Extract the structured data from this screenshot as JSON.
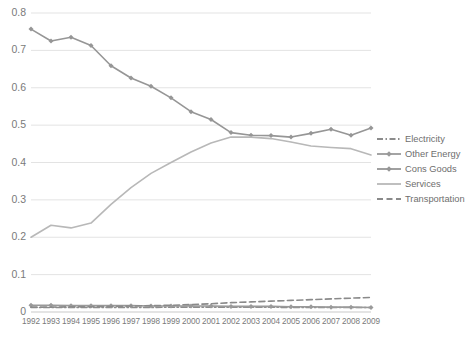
{
  "chart_data": {
    "type": "line",
    "title": "",
    "xlabel": "",
    "ylabel": "",
    "x": [
      1992,
      1993,
      1994,
      1995,
      1996,
      1997,
      1998,
      1999,
      2000,
      2001,
      2002,
      2003,
      2004,
      2005,
      2006,
      2007,
      2008,
      2009
    ],
    "xtick_labels": [
      "1992",
      "1993",
      "1994",
      "1995",
      "1996",
      "1997",
      "1998",
      "1999",
      "2000",
      "2001",
      "2002",
      "2003",
      "2004",
      "2005",
      "2006",
      "2007",
      "2008",
      "2009"
    ],
    "ytick_labels": [
      "0",
      "0.1",
      "0.2",
      "0.3",
      "0.4",
      "0.5",
      "0.6",
      "0.7",
      "0.8"
    ],
    "yticks": [
      0,
      0.1,
      0.2,
      0.3,
      0.4,
      0.5,
      0.6,
      0.7,
      0.8
    ],
    "ylim": [
      0,
      0.8
    ],
    "grid": "horizontal",
    "legend_position": "right",
    "series": [
      {
        "name": "Electricity",
        "color": "#8c8c8c",
        "style": "dash-dot",
        "marker": "none",
        "values": [
          0.012,
          0.012,
          0.012,
          0.012,
          0.012,
          0.012,
          0.012,
          0.013,
          0.013,
          0.013,
          0.013,
          0.013,
          0.013,
          0.012,
          0.012,
          0.012,
          0.012,
          0.012
        ]
      },
      {
        "name": "Other Energy",
        "color": "#9a9a9a",
        "style": "solid",
        "marker": "diamond",
        "values": [
          0.018,
          0.018,
          0.017,
          0.017,
          0.017,
          0.017,
          0.016,
          0.016,
          0.016,
          0.016,
          0.015,
          0.015,
          0.015,
          0.014,
          0.014,
          0.013,
          0.013,
          0.012
        ]
      },
      {
        "name": "Cons Goods",
        "color": "#969696",
        "style": "solid",
        "marker": "diamond",
        "values": [
          0.757,
          0.725,
          0.735,
          0.713,
          0.659,
          0.626,
          0.604,
          0.573,
          0.536,
          0.515,
          0.48,
          0.473,
          0.472,
          0.468,
          0.478,
          0.489,
          0.473,
          0.492
        ]
      },
      {
        "name": "Services",
        "color": "#b8b8b8",
        "style": "solid",
        "marker": "none",
        "values": [
          0.2,
          0.232,
          0.225,
          0.238,
          0.288,
          0.333,
          0.371,
          0.4,
          0.428,
          0.452,
          0.468,
          0.468,
          0.464,
          0.455,
          0.444,
          0.44,
          0.437,
          0.42
        ]
      },
      {
        "name": "Transportation",
        "color": "#8a8a8a",
        "style": "dashed",
        "marker": "none",
        "values": [
          0.013,
          0.013,
          0.014,
          0.014,
          0.015,
          0.016,
          0.017,
          0.018,
          0.02,
          0.022,
          0.025,
          0.027,
          0.029,
          0.031,
          0.033,
          0.035,
          0.037,
          0.039
        ]
      }
    ]
  }
}
